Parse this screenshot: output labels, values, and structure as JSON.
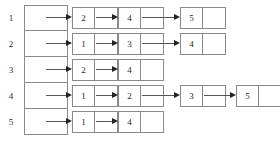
{
  "figure": {
    "kind": "adjacency-list",
    "vertex_count": 5,
    "colors": {
      "box_border": "#8a8a8a",
      "arrow": "#555555",
      "arrow_head": "#222222",
      "text": "#1f1f1f",
      "background": "#ffffff"
    }
  },
  "head_array": {
    "label": "head array",
    "cells": [
      {
        "index_label": "1"
      },
      {
        "index_label": "2"
      },
      {
        "index_label": "3"
      },
      {
        "index_label": "4"
      },
      {
        "index_label": "5"
      }
    ]
  },
  "adjacency": [
    {
      "vertex": "1",
      "neighbors": [
        "2",
        "4",
        "5"
      ]
    },
    {
      "vertex": "2",
      "neighbors": [
        "1",
        "3",
        "4"
      ]
    },
    {
      "vertex": "3",
      "neighbors": [
        "2",
        "4"
      ]
    },
    {
      "vertex": "4",
      "neighbors": [
        "1",
        "2",
        "3",
        "5"
      ]
    },
    {
      "vertex": "5",
      "neighbors": [
        "1",
        "4"
      ]
    }
  ],
  "layout": {
    "row_tops": [
      5,
      31,
      57,
      83,
      109
    ],
    "head_cell_left": 24,
    "head_cell_width": 44,
    "node_width": 46,
    "node_slot_starts": [
      72,
      118,
      180,
      236
    ],
    "arrow_gap": 16
  }
}
